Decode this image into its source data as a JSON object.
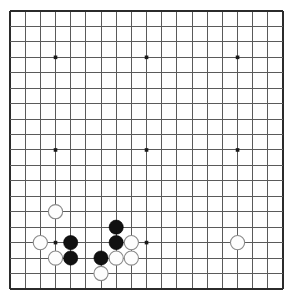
{
  "board": {
    "name": "go-board",
    "size": 19,
    "origin_x": 10,
    "origin_y": 11,
    "spacing_x": 15.17,
    "spacing_y": 15.44,
    "stone_radius": 7.1,
    "line_color": "#5a5a5a",
    "edge_color": "#2b2b2b",
    "background_color": "#ffffff",
    "black_color": "#111111",
    "white_color": "#fdfdfd",
    "white_outline_color": "#8a8a8a",
    "star_points": [
      {
        "col": 3,
        "row": 3
      },
      {
        "col": 9,
        "row": 3
      },
      {
        "col": 15,
        "row": 3
      },
      {
        "col": 3,
        "row": 9
      },
      {
        "col": 9,
        "row": 9
      },
      {
        "col": 15,
        "row": 9
      },
      {
        "col": 3,
        "row": 15
      },
      {
        "col": 9,
        "row": 15
      },
      {
        "col": 15,
        "row": 15
      }
    ],
    "stones": [
      {
        "color": "white",
        "col": 3,
        "row": 13
      },
      {
        "color": "white",
        "col": 2,
        "row": 15
      },
      {
        "color": "black",
        "col": 4,
        "row": 15
      },
      {
        "color": "white",
        "col": 3,
        "row": 16
      },
      {
        "color": "black",
        "col": 4,
        "row": 16
      },
      {
        "color": "black",
        "col": 7,
        "row": 14
      },
      {
        "color": "black",
        "col": 7,
        "row": 15
      },
      {
        "color": "white",
        "col": 8,
        "row": 15
      },
      {
        "color": "black",
        "col": 6,
        "row": 16
      },
      {
        "color": "white",
        "col": 7,
        "row": 16
      },
      {
        "color": "white",
        "col": 8,
        "row": 16
      },
      {
        "color": "white",
        "col": 6,
        "row": 17
      },
      {
        "color": "white",
        "col": 15,
        "row": 15
      }
    ],
    "black_stone_count": 5,
    "white_stone_count": 8
  }
}
